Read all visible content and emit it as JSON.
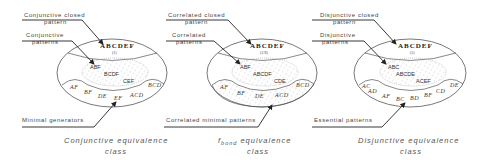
{
  "panels": [
    {
      "id": "conjunctive",
      "closed_label": [
        "Conjunctive closed",
        "pattern"
      ],
      "patterns_label": [
        "Conjunctive",
        "patterns"
      ],
      "minimal_label": "Minimal generators",
      "closed_pattern": "ABCDEF",
      "support": "(1)",
      "patterns": [
        "ABF",
        "BCDF",
        "CEF"
      ],
      "minimal_patterns": [
        "AF",
        "BF",
        "DE",
        "EF",
        "ACD",
        "BCD"
      ],
      "caption": [
        "Conjunctive equivalence",
        "class"
      ]
    },
    {
      "id": "fbond",
      "closed_label": [
        "Correlated closed",
        "pattern"
      ],
      "patterns_label": [
        "Correlated",
        "patterns"
      ],
      "minimal_label": "Correlated minimal patterns",
      "closed_pattern": "ABCDEF",
      "support": "(1/8)",
      "patterns": [
        "ABF",
        "ABCDF",
        "CDE"
      ],
      "minimal_patterns": [
        "AF",
        "BF",
        "DE",
        "ACD",
        "BCD"
      ],
      "caption_prefix": "f",
      "caption_sub": "bond",
      "caption": [
        " equivalence",
        "class"
      ]
    },
    {
      "id": "disjunctive",
      "closed_label": [
        "Disjunctive closed",
        "pattern"
      ],
      "patterns_label": [
        "Disjunctive",
        "patterns"
      ],
      "minimal_label": "Essential patterns",
      "closed_pattern": "ABCDEF",
      "support": "(5)",
      "patterns": [
        "ABC",
        "ABCDE",
        "ACEF"
      ],
      "minimal_patterns": [
        "AC",
        "AD",
        "AF",
        "BC",
        "BD",
        "BF",
        "CD",
        "DE"
      ],
      "caption": [
        "Disjunctive equivalence",
        "class"
      ]
    }
  ]
}
